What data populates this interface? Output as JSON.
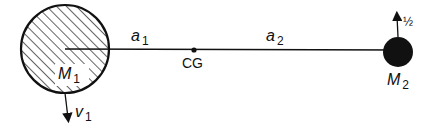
{
  "diagram": {
    "type": "two-body orbit center of gravity",
    "bodies": [
      {
        "id": "M1",
        "label": "M",
        "subscript": "1",
        "style": "hatched",
        "size": "large",
        "velocity": {
          "label": "v",
          "subscript": "1",
          "direction": "down"
        }
      },
      {
        "id": "M2",
        "label": "M",
        "subscript": "2",
        "style": "solid-black",
        "size": "small",
        "velocity": {
          "label": "½",
          "direction": "up"
        }
      }
    ],
    "center_of_gravity": {
      "label": "CG"
    },
    "distances": [
      {
        "label": "a",
        "subscript": "1",
        "from": "M1",
        "to": "CG"
      },
      {
        "label": "a",
        "subscript": "2",
        "from": "CG",
        "to": "M2"
      }
    ],
    "colors": {
      "ink": "#111111",
      "background": "#ffffff"
    }
  }
}
